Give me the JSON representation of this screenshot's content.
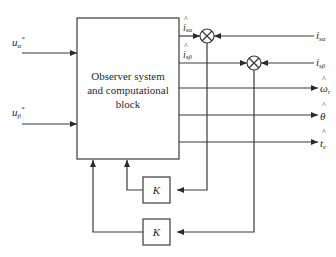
{
  "diagram": {
    "main_block": {
      "label_lines": [
        "Observer system",
        "and computational",
        "block"
      ]
    },
    "inputs": [
      {
        "id": "u_alpha",
        "symbol": "u",
        "subscript": "α",
        "superscript": "*"
      },
      {
        "id": "u_beta",
        "symbol": "u",
        "subscript": "β",
        "superscript": "*"
      }
    ],
    "estimated_currents": [
      {
        "id": "i_s_alpha_hat",
        "symbol": "i",
        "subscript": "sα",
        "hat": "^"
      },
      {
        "id": "i_s_beta_hat",
        "symbol": "i",
        "subscript": "sβ",
        "hat": "^"
      }
    ],
    "measured_currents": [
      {
        "id": "i_s_alpha",
        "symbol": "i",
        "subscript": "sα"
      },
      {
        "id": "i_s_beta",
        "symbol": "i",
        "subscript": "sβ"
      }
    ],
    "outputs": [
      {
        "id": "omega_r_hat",
        "symbol": "ω",
        "subscript": "r",
        "hat": "^"
      },
      {
        "id": "theta_hat",
        "symbol": "θ",
        "subscript": "",
        "hat": "^"
      },
      {
        "id": "t_e_hat",
        "symbol": "t",
        "subscript": "e",
        "hat": "^"
      }
    ],
    "summing_junctions": [
      {
        "id": "sum_alpha",
        "signs": [
          "+",
          "-"
        ]
      },
      {
        "id": "sum_beta",
        "signs": [
          "+",
          "-"
        ]
      }
    ],
    "gain_blocks": [
      {
        "id": "gain_alpha",
        "label": "K"
      },
      {
        "id": "gain_beta",
        "label": "K"
      }
    ]
  }
}
